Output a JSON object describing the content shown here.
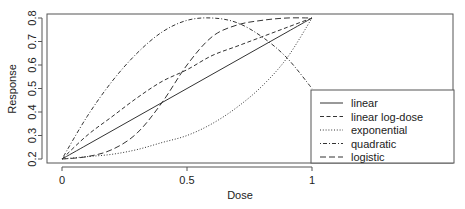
{
  "chart_data": {
    "type": "line",
    "title": "",
    "xlabel": "Dose",
    "ylabel": "Response",
    "xlim": [
      0,
      1
    ],
    "ylim": [
      0.2,
      0.8
    ],
    "xticks": [
      "0",
      "0.5",
      "1"
    ],
    "yticks": [
      "0.2",
      "0.3",
      "0.4",
      "0.5",
      "0.6",
      "0.7",
      "0.8"
    ],
    "grid": false,
    "legend_position": "bottom-right",
    "x": [
      0,
      0.1,
      0.2,
      0.3,
      0.4,
      0.5,
      0.6,
      0.7,
      0.8,
      0.9,
      1.0
    ],
    "series": [
      {
        "name": "linear",
        "style": "solid",
        "values": [
          0.2,
          0.26,
          0.32,
          0.38,
          0.44,
          0.5,
          0.56,
          0.62,
          0.68,
          0.74,
          0.8
        ]
      },
      {
        "name": "linear log-dose",
        "style": "dashed",
        "values": [
          0.2,
          0.3,
          0.38,
          0.46,
          0.53,
          0.58,
          0.64,
          0.68,
          0.72,
          0.76,
          0.8
        ]
      },
      {
        "name": "exponential",
        "style": "dotted",
        "values": [
          0.2,
          0.21,
          0.22,
          0.24,
          0.27,
          0.3,
          0.35,
          0.42,
          0.51,
          0.63,
          0.8
        ]
      },
      {
        "name": "quadratic",
        "style": "dotdash",
        "values": [
          0.2,
          0.38,
          0.53,
          0.65,
          0.74,
          0.79,
          0.8,
          0.78,
          0.72,
          0.63,
          0.5
        ]
      },
      {
        "name": "logistic",
        "style": "longdash",
        "values": [
          0.2,
          0.21,
          0.24,
          0.31,
          0.44,
          0.6,
          0.72,
          0.77,
          0.79,
          0.8,
          0.8
        ]
      }
    ]
  },
  "legend": {
    "items": [
      "linear",
      "linear log-dose",
      "exponential",
      "quadratic",
      "logistic"
    ]
  }
}
